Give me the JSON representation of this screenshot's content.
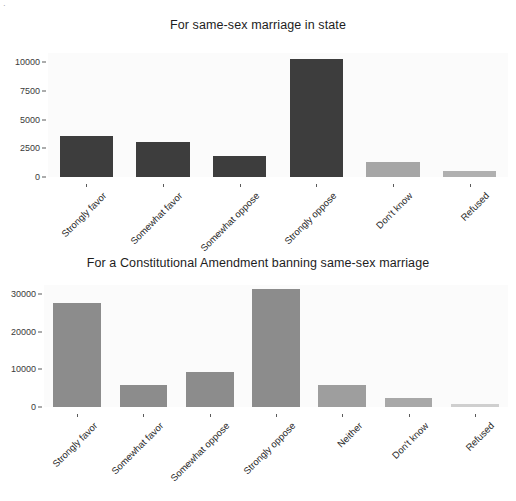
{
  "figure": {
    "background_color": "#ffffff",
    "panel_background_color": "#fbfbfb",
    "corner_mark": "·"
  },
  "chart_data": [
    {
      "type": "bar",
      "title": "For same-sex marriage in state",
      "xlabel": "",
      "ylabel": "",
      "categories": [
        "Strongly favor",
        "Somewhat favor",
        "Somewhat oppose",
        "Strongly oppose",
        "Don't know",
        "Refused"
      ],
      "values": [
        3600,
        3050,
        1800,
        10250,
        1350,
        540
      ],
      "bar_colors": [
        "#3d3d3d",
        "#3d3d3d",
        "#3d3d3d",
        "#3d3d3d",
        "#a6a6a6",
        "#b0b0b0"
      ],
      "ylim": [
        0,
        10800
      ],
      "yticks": [
        0,
        2500,
        5000,
        7500,
        10000
      ],
      "ytick_labels": [
        "0",
        "2500",
        "5000",
        "7500",
        "10000"
      ],
      "grid": false,
      "legend": "none"
    },
    {
      "type": "bar",
      "title": "For a Constitutional Amendment banning same-sex marriage",
      "xlabel": "",
      "ylabel": "",
      "categories": [
        "Strongly favor",
        "Somewhat favor",
        "Somewhat oppose",
        "Strongly oppose",
        "Neither",
        "Don't know",
        "Refused"
      ],
      "values": [
        27700,
        5800,
        9400,
        31400,
        5900,
        2450,
        850
      ],
      "bar_colors": [
        "#8c8c8c",
        "#8c8c8c",
        "#8c8c8c",
        "#8c8c8c",
        "#9e9e9e",
        "#a8a8a8",
        "#cfcfcf"
      ],
      "ylim": [
        0,
        32500
      ],
      "yticks": [
        0,
        10000,
        20000,
        30000
      ],
      "ytick_labels": [
        "0",
        "10000",
        "20000",
        "30000"
      ],
      "grid": false,
      "legend": "none"
    }
  ]
}
